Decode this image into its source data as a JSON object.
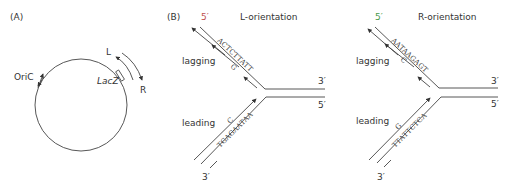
{
  "panel_a": {
    "label": "(A)",
    "origin_label": "OriC",
    "gene_label": "LacZ",
    "left_label": "L",
    "right_label": "R"
  },
  "panel_b_left": {
    "label": "(B)",
    "title": "L-orientation",
    "top_five_prime": "5′",
    "right_three_prime": "3′",
    "right_five_prime": "5′",
    "bottom_three_prime": "3′",
    "lagging_label": "lagging",
    "leading_label": "leading",
    "lagging_sequence": "ACTCTTATT",
    "lagging_mismatch": "G",
    "leading_sequence": "TGAGAATAA",
    "leading_mismatch": "C"
  },
  "panel_b_right": {
    "title": "R-orientation",
    "top_five_prime": "5′",
    "right_three_prime": "3′",
    "right_five_prime": "5′",
    "bottom_three_prime": "3′",
    "lagging_label": "lagging",
    "leading_label": "leading",
    "lagging_sequence": "AATAAGAGT",
    "lagging_mismatch": "C",
    "leading_sequence": "TTATTCTCA",
    "leading_mismatch": "G"
  },
  "colors": {
    "line": "#444444",
    "five_prime_left": "#c0504d",
    "five_prime_right": "#4a9a4a",
    "text": "#333333"
  }
}
